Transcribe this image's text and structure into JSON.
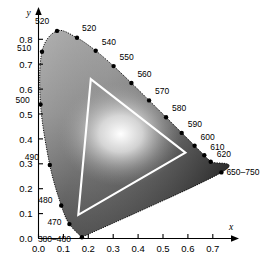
{
  "chart_data": {
    "type": "scatter",
    "title": "",
    "subtitle": "",
    "xlabel": "x",
    "ylabel": "y",
    "xlim": [
      0.0,
      0.75
    ],
    "ylim": [
      0.0,
      0.88
    ],
    "grid": false,
    "legend": "none",
    "xticks": [
      "0.0",
      "0.1",
      "0.2",
      "0.3",
      "0.4",
      "0.5",
      "0.6",
      "0.7"
    ],
    "xtick_values": [
      0.0,
      0.1,
      0.2,
      0.3,
      0.4,
      0.5,
      0.6,
      0.7
    ],
    "yticks": [
      "0.0",
      "0.1",
      "0.2",
      "0.3",
      "0.4",
      "0.5",
      "0.6",
      "0.7",
      "0.8"
    ],
    "ytick_values": [
      0.0,
      0.1,
      0.2,
      0.3,
      0.4,
      0.5,
      0.6,
      0.7,
      0.8
    ],
    "series": [
      {
        "name": "spectral-locus-wavelength-markers",
        "points": [
          {
            "label": "380–480",
            "x": 0.1741,
            "y": 0.005,
            "lx": -44,
            "ly": 5
          },
          {
            "label": "470",
            "x": 0.1241,
            "y": 0.0578,
            "lx": -22,
            "ly": 1
          },
          {
            "label": "480",
            "x": 0.0913,
            "y": 0.1327,
            "lx": -23,
            "ly": -3
          },
          {
            "label": "490",
            "x": 0.0454,
            "y": 0.295,
            "lx": -25,
            "ly": -5
          },
          {
            "label": "500",
            "x": 0.0082,
            "y": 0.5384,
            "lx": -25,
            "ly": -1
          },
          {
            "label": "510",
            "x": 0.0139,
            "y": 0.7502,
            "lx": -25,
            "ly": -1
          },
          {
            "label": "520",
            "x": 0.0743,
            "y": 0.8338,
            "lx": -22,
            "ly": -7
          },
          {
            "label": "520",
            "x": 0.1547,
            "y": 0.8059,
            "lx": 5,
            "ly": -7
          },
          {
            "label": "540",
            "x": 0.2296,
            "y": 0.7543,
            "lx": 6,
            "ly": -6
          },
          {
            "label": "550",
            "x": 0.3016,
            "y": 0.6923,
            "lx": 6,
            "ly": -6
          },
          {
            "label": "560",
            "x": 0.3731,
            "y": 0.6245,
            "lx": 6,
            "ly": -6
          },
          {
            "label": "570",
            "x": 0.4441,
            "y": 0.5547,
            "lx": 6,
            "ly": -6
          },
          {
            "label": "580",
            "x": 0.5125,
            "y": 0.4866,
            "lx": 6,
            "ly": -6
          },
          {
            "label": "590",
            "x": 0.5752,
            "y": 0.4242,
            "lx": 6,
            "ly": -6
          },
          {
            "label": "600",
            "x": 0.627,
            "y": 0.3725,
            "lx": 6,
            "ly": -6
          },
          {
            "label": "610",
            "x": 0.6658,
            "y": 0.334,
            "lx": 6,
            "ly": -5
          },
          {
            "label": "620",
            "x": 0.6915,
            "y": 0.3083,
            "lx": 6,
            "ly": -5
          },
          {
            "label": "650–750",
            "x": 0.7347,
            "y": 0.2653,
            "lx": 5,
            "ly": 3
          }
        ]
      },
      {
        "name": "rgb-gamut-triangle",
        "vertices": [
          {
            "name": "green-primary",
            "x": 0.21,
            "y": 0.64
          },
          {
            "name": "red-primary",
            "x": 0.59,
            "y": 0.345
          },
          {
            "name": "blue-primary",
            "x": 0.16,
            "y": 0.095
          }
        ]
      }
    ],
    "annotations": [
      {
        "name": "white-point-glow",
        "x": 0.33,
        "y": 0.42
      }
    ]
  },
  "colors": {
    "axis": "#000000",
    "locus_dot": "#000000",
    "gamut_stroke": "#ffffff",
    "background": "#ffffff"
  }
}
